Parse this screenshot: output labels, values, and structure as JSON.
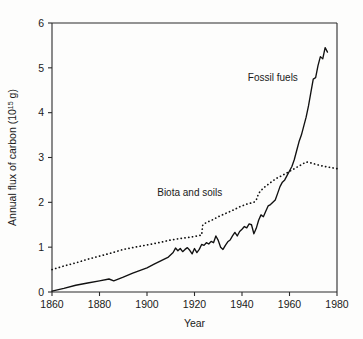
{
  "chart_data": {
    "type": "line",
    "title": "",
    "subtitle": "",
    "xlabel": "Year",
    "ylabel": "Annual flux of carbon (10¹⁵ g)",
    "ylabel_base": "Annual flux of carbon (10",
    "ylabel_exponent": "15",
    "ylabel_tail": " g)",
    "xlim": [
      1860,
      1980
    ],
    "ylim": [
      0,
      6
    ],
    "xticks": [
      1860,
      1880,
      1900,
      1920,
      1940,
      1960,
      1980
    ],
    "xtick_labels": [
      "1860",
      "1880",
      "1900",
      "1920",
      "1940",
      "1960",
      "1980"
    ],
    "yticks": [
      0,
      1,
      2,
      3,
      4,
      5,
      6
    ],
    "ytick_labels": [
      "0",
      "1",
      "2",
      "3",
      "4",
      "5",
      "6"
    ],
    "grid": false,
    "legend_position": "inline-annotations",
    "series": [
      {
        "name": "Fossil fuels",
        "style": "solid",
        "label_text": "Fossil fuels",
        "x": [
          1860,
          1865,
          1870,
          1875,
          1880,
          1884,
          1886,
          1890,
          1894,
          1898,
          1900,
          1903,
          1906,
          1909,
          1911,
          1912,
          1913,
          1914,
          1915,
          1916,
          1917,
          1918,
          1919,
          1920,
          1921,
          1922,
          1923,
          1924,
          1925,
          1926,
          1927,
          1928,
          1929,
          1930,
          1931,
          1932,
          1933,
          1934,
          1935,
          1936,
          1937,
          1938,
          1939,
          1940,
          1941,
          1942,
          1943,
          1944,
          1945,
          1946,
          1947,
          1948,
          1949,
          1950,
          1951,
          1952,
          1953,
          1954,
          1955,
          1956,
          1957,
          1958,
          1959,
          1960,
          1961,
          1962,
          1963,
          1964,
          1965,
          1966,
          1967,
          1968,
          1969,
          1970,
          1971,
          1972,
          1973,
          1974,
          1975,
          1976
        ],
        "y": [
          0.02,
          0.08,
          0.15,
          0.2,
          0.25,
          0.29,
          0.25,
          0.33,
          0.42,
          0.5,
          0.54,
          0.62,
          0.7,
          0.78,
          0.88,
          0.98,
          0.92,
          0.97,
          0.9,
          0.95,
          0.99,
          0.93,
          0.85,
          0.97,
          0.88,
          0.95,
          1.06,
          1.04,
          1.1,
          1.07,
          1.13,
          1.1,
          1.25,
          1.15,
          1.0,
          0.95,
          1.04,
          1.12,
          1.16,
          1.25,
          1.33,
          1.25,
          1.35,
          1.4,
          1.46,
          1.43,
          1.52,
          1.5,
          1.3,
          1.42,
          1.6,
          1.72,
          1.68,
          1.8,
          1.92,
          1.95,
          2.0,
          2.05,
          2.2,
          2.35,
          2.45,
          2.5,
          2.6,
          2.7,
          2.8,
          2.95,
          3.15,
          3.35,
          3.5,
          3.7,
          3.9,
          4.15,
          4.45,
          4.75,
          4.78,
          5.05,
          5.25,
          5.2,
          5.45,
          5.35
        ]
      },
      {
        "name": "Biota and soils",
        "style": "dotted",
        "label_text": "Biota and soils",
        "x": [
          1860,
          1865,
          1870,
          1875,
          1880,
          1885,
          1890,
          1895,
          1900,
          1905,
          1910,
          1915,
          1918,
          1920,
          1922,
          1923,
          1923.5,
          1925,
          1928,
          1930,
          1933,
          1936,
          1939,
          1942,
          1945,
          1946,
          1947,
          1949,
          1951,
          1953,
          1955,
          1957,
          1959,
          1961,
          1963,
          1965,
          1967,
          1969,
          1971,
          1973,
          1975,
          1977,
          1979,
          1980
        ],
        "y": [
          0.5,
          0.58,
          0.65,
          0.73,
          0.8,
          0.87,
          0.95,
          1.0,
          1.05,
          1.1,
          1.16,
          1.2,
          1.22,
          1.24,
          1.26,
          1.27,
          1.5,
          1.55,
          1.62,
          1.68,
          1.75,
          1.82,
          1.9,
          1.96,
          2.0,
          2.05,
          2.2,
          2.32,
          2.4,
          2.48,
          2.55,
          2.6,
          2.66,
          2.72,
          2.78,
          2.84,
          2.9,
          2.88,
          2.85,
          2.82,
          2.8,
          2.78,
          2.76,
          2.75
        ]
      }
    ],
    "annotations": [
      {
        "text": "Fossil fuels",
        "x": 1953,
        "y": 4.7
      },
      {
        "text": "Biota and soils",
        "x": 1918,
        "y": 2.15
      }
    ]
  },
  "colors": {
    "background": "#fdfdfc",
    "axis": "#2b2b2b",
    "line": "#111111",
    "text": "#1a1a1a"
  }
}
